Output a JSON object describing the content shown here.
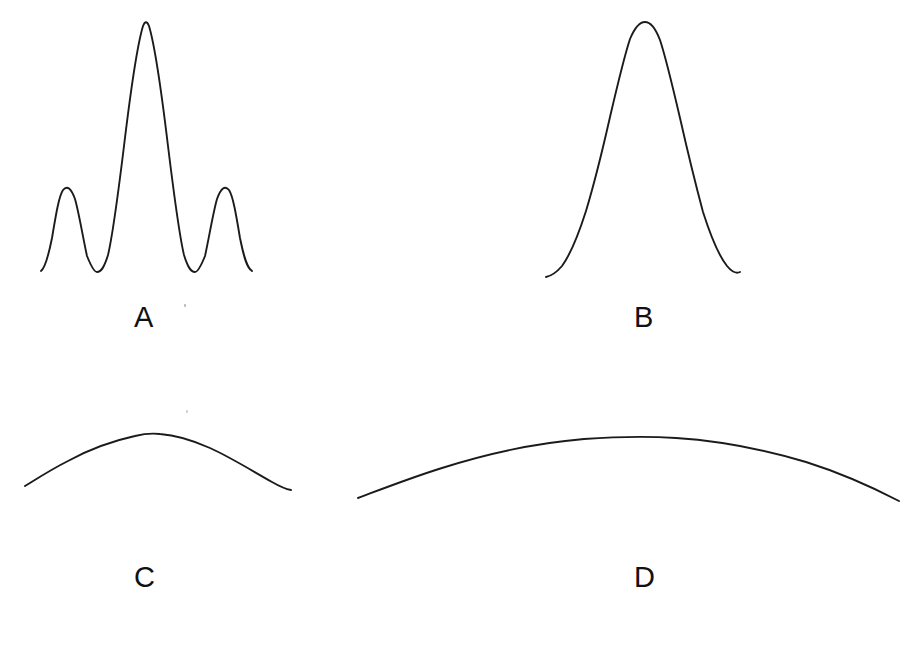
{
  "figure": {
    "background_color": "#ffffff",
    "stroke_color": "#1b1b1b",
    "width": 917,
    "height": 661,
    "label_color": "#111111"
  },
  "panels": [
    {
      "id": "panel-a",
      "label": "A",
      "label_x": 134,
      "label_y": 303,
      "description": "Narrow central maximum with two symmetric side lobes (sinc-squared / multi-slit diffraction pattern)",
      "curve_type": "multi-peak",
      "x_start": 41,
      "x_end": 253,
      "baseline_y": 272,
      "peaks": [
        {
          "x": 63,
          "y": 190,
          "relative_height": 0.33
        },
        {
          "x": 146,
          "y": 22,
          "relative_height": 1.0
        },
        {
          "x": 231,
          "y": 190,
          "relative_height": 0.33
        }
      ],
      "troughs": [
        {
          "x": 97,
          "y": 272
        },
        {
          "x": 200,
          "y": 272
        }
      ]
    },
    {
      "id": "panel-b",
      "label": "B",
      "label_x": 634,
      "label_y": 303,
      "description": "Single broad rounded central maximum, no side lobes",
      "curve_type": "single-bell",
      "x_start": 546,
      "x_end": 740,
      "baseline_y": 275,
      "peaks": [
        {
          "x": 645,
          "y": 23,
          "relative_height": 1.0
        }
      ],
      "troughs": []
    },
    {
      "id": "panel-c",
      "label": "C",
      "label_x": 134,
      "label_y": 563,
      "description": "Very shallow wide arc, low amplitude broad maximum",
      "curve_type": "shallow-arc",
      "x_start": 25,
      "x_end": 291,
      "baseline_y": 490,
      "peaks": [
        {
          "x": 155,
          "y": 434,
          "relative_height": 1.0
        }
      ],
      "troughs": []
    },
    {
      "id": "panel-d",
      "label": "D",
      "label_x": 634,
      "label_y": 563,
      "description": "Extremely broad and shallow arc spanning the full panel width",
      "curve_type": "shallow-arc",
      "x_start": 358,
      "x_end": 900,
      "baseline_y": 501,
      "peaks": [
        {
          "x": 637,
          "y": 438,
          "relative_height": 1.0
        }
      ],
      "troughs": []
    }
  ],
  "paths": {
    "panel_a": "M 41 271 C 45 268 48 258 52 238 C 56 214 59 196 63 190 C 67 185 71 188 75 199 C 79 213 83 238 87 256 C 91 266 94 272 97 272 C 101 272 104 268 108 255 C 113 234 118 195 124 146 C 130 96 137 46 143 26 C 145 21 147 21 149 26 C 155 46 162 96 168 146 C 174 195 179 234 184 255 C 188 268 191 272 195 272 C 198 272 201 266 205 256 C 209 238 213 213 217 199 C 221 188 225 185 229 190 C 233 196 236 214 240 238 C 244 258 247 268 252 271",
    "panel_b": "M 546 277 C 551 276 556 273 562 266 C 570 255 578 236 586 211 C 595 181 603 148 610 117 C 617 87 624 57 630 39 C 635 27 640 22 645 22 C 650 22 655 27 660 40 C 666 58 673 88 680 118 C 687 149 695 182 703 212 C 711 237 719 256 727 266 C 732 272 736 274 740 272",
    "panel_c": "M 25 486 C 38 478 52 469 68 461 C 88 450 112 441 135 436 C 143 434 152 433 160 434 C 175 435 192 440 210 448 C 232 458 254 472 272 482 C 279 486 285 489 291 490",
    "panel_d": "M 358 498 C 382 489 410 478 442 468 C 486 454 536 443 584 439 C 612 437 646 436 676 438 C 722 441 766 450 806 462 C 841 473 872 487 899 501"
  }
}
